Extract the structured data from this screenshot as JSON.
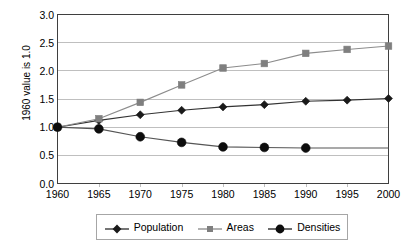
{
  "chart_data": {
    "type": "line",
    "title": "",
    "subtitle": "",
    "xlabel": "",
    "ylabel": "1960 value is 1.0",
    "x": [
      1960,
      1965,
      1970,
      1975,
      1980,
      1985,
      1990,
      1995,
      2000
    ],
    "categories": [
      "1960",
      "1965",
      "1970",
      "1975",
      "1980",
      "1985",
      "1990",
      "1995",
      "2000"
    ],
    "xtick_labels": [
      "1960",
      "1965",
      "1970",
      "1975",
      "1980",
      "1985",
      "1990",
      "1995",
      "2000"
    ],
    "ytick_labels": [
      "0.0",
      "0.5",
      "1.0",
      "1.5",
      "2.0",
      "2.5",
      "3.0"
    ],
    "ytick_values": [
      0.0,
      0.5,
      1.0,
      1.5,
      2.0,
      2.5,
      3.0
    ],
    "ylim": [
      0.0,
      3.0
    ],
    "xlim": [
      1960,
      2000
    ],
    "grid": "horizontal",
    "legend_position": "bottom",
    "series": [
      {
        "name": "Population",
        "marker": "diamond",
        "color": "#1a1a1a",
        "line_color": "#333333",
        "values": [
          1.0,
          1.12,
          1.22,
          1.3,
          1.36,
          1.4,
          1.46,
          1.48,
          1.51
        ],
        "markers_shown_through": 2000
      },
      {
        "name": "Areas",
        "marker": "square",
        "color": "#7f7f7f",
        "line_color": "#8c8c8c",
        "values": [
          1.0,
          1.15,
          1.44,
          1.75,
          2.05,
          2.13,
          2.31,
          2.38,
          2.44
        ],
        "markers_shown_through": 2000
      },
      {
        "name": "Densities",
        "marker": "circle",
        "color": "#0d0d0d",
        "line_color": "#555555",
        "values": [
          1.0,
          0.97,
          0.83,
          0.73,
          0.65,
          0.64,
          0.63,
          0.63,
          0.63
        ],
        "markers_shown_through": 1990
      }
    ]
  },
  "legend": {
    "entries": [
      {
        "label": "Population",
        "marker": "diamond-marker",
        "color": "#1a1a1a"
      },
      {
        "label": "Areas",
        "marker": "square-marker",
        "color": "#7f7f7f"
      },
      {
        "label": "Densities",
        "marker": "circle-marker",
        "color": "#0d0d0d"
      }
    ]
  },
  "axes": {
    "y_title": "1960 value is 1.0"
  },
  "colors": {
    "plot_border": "#3f3f3f",
    "gridline": "#bfbfbf",
    "legend_border": "#a6a6a6",
    "background": "#ffffff"
  }
}
